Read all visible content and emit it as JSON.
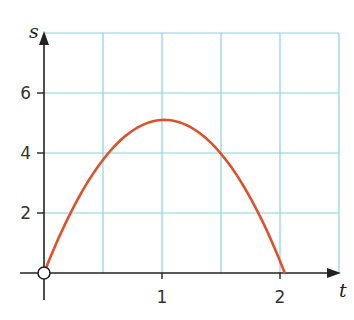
{
  "chart_data": {
    "type": "line",
    "title": "",
    "xlabel": "t",
    "ylabel": "s",
    "xlim": [
      0,
      2.5
    ],
    "ylim": [
      0,
      8
    ],
    "grid": true,
    "grid_x_step": 0.5,
    "grid_y_step": 2,
    "x_ticks": [
      1,
      2
    ],
    "x_tick_labels": [
      "1",
      "2"
    ],
    "y_ticks": [
      2,
      4,
      6
    ],
    "y_tick_labels": [
      "2",
      "4",
      "6"
    ],
    "series": [
      {
        "name": "s(t)",
        "color": "#e0502a",
        "function": "s = 10t - 4.9t^2",
        "x": [
          0,
          0.25,
          0.5,
          0.75,
          1.0,
          1.25,
          1.5,
          1.75,
          2.0,
          2.04
        ],
        "y": [
          0,
          2.19,
          3.78,
          4.74,
          5.1,
          4.84,
          3.98,
          2.49,
          0.4,
          0
        ]
      }
    ],
    "annotations": [
      {
        "type": "open-circle",
        "x": 0,
        "y": 0
      }
    ]
  },
  "colors": {
    "grid": "#86d3e6",
    "curve": "#e0502a",
    "axis": "#222222"
  }
}
